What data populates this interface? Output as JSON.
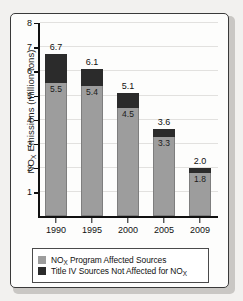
{
  "chart_data": {
    "type": "bar",
    "subtype": "stacked",
    "title": "",
    "xlabel": "",
    "ylabel": "NOX Emissions (million tons)",
    "ylabel_parts": {
      "pre": "NO",
      "sub": "X",
      "post": " Emissions (million tons)"
    },
    "categories": [
      "1990",
      "1995",
      "2000",
      "2005",
      "2009"
    ],
    "ylim": [
      0,
      8
    ],
    "yticks": [
      1,
      2,
      3,
      4,
      5,
      6,
      7,
      8
    ],
    "ytick_labels": [
      "1",
      "2",
      "3",
      "4",
      "5",
      "6",
      "7",
      "8"
    ],
    "grid": true,
    "grid_axis": "y",
    "legend_position": "below-plot",
    "series": [
      {
        "name": "NOX Program Affected Sources",
        "color": "#9d9d9d",
        "values": [
          5.5,
          5.4,
          4.5,
          3.3,
          1.8
        ],
        "value_labels": [
          "5.5",
          "5.4",
          "4.5",
          "3.3",
          "1.8"
        ]
      },
      {
        "name": "Title IV Sources Not Affected for NOX",
        "color": "#2b2b2b",
        "values": [
          1.2,
          0.7,
          0.6,
          0.3,
          0.2
        ],
        "value_labels": [
          "",
          "",
          "",
          "",
          ""
        ]
      }
    ],
    "totals": [
      6.7,
      6.1,
      5.1,
      3.6,
      2.0
    ],
    "total_labels": [
      "6.7",
      "6.1",
      "5.1",
      "3.6",
      "2.0"
    ]
  },
  "legend": {
    "items": [
      {
        "swatch": "gray",
        "color": "#9d9d9d",
        "label_pre": "NO",
        "label_sub": "X",
        "label_post": " Program Affected Sources"
      },
      {
        "swatch": "dark",
        "color": "#2b2b2b",
        "label_pre": "Title IV Sources Not Affected for NO",
        "label_sub": "X",
        "label_post": ""
      }
    ]
  },
  "style": {
    "background": "#f2f1ef",
    "card_background": "#fdfdfc",
    "frame_color": "#3a3a3a",
    "axis_color": "#111111",
    "grid_color": "#e2e1df"
  }
}
